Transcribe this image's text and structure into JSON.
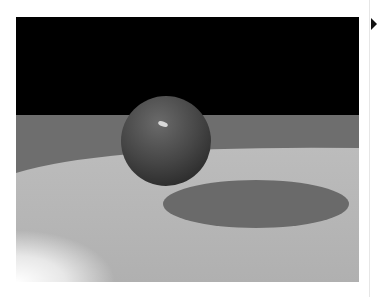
{
  "figure": {
    "colors": {
      "sky": "#000000",
      "far_floor": "#6e6e6e",
      "lit_floor": "#b4b4b4",
      "shadow": "#6a6a6a",
      "sphere": "#4a4a4a",
      "highlight": "#d8d8d8"
    }
  },
  "page": {
    "marker_icon": "triangle-right-icon"
  }
}
